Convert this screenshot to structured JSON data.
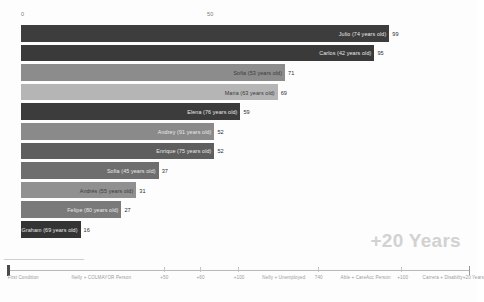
{
  "chart_data": {
    "type": "bar",
    "orientation": "horizontal",
    "title": "",
    "xlabel": "",
    "ylabel": "",
    "xlim": [
      0,
      110
    ],
    "grid": false,
    "axis_ticks": [
      {
        "label": "0",
        "value": 0
      },
      {
        "label": "50",
        "value": 50
      }
    ],
    "categories": [
      "Julio (74 years old)",
      "Carlos (42 years old)",
      "Sofia (53 years old)",
      "Maria (63 years old)",
      "Elena (76 years old)",
      "Andrey (91 years old)",
      "Enrique (75 years old)",
      "Sofia (45 years old)",
      "Andrés (55 years old)",
      "Felipe (80 years old)",
      "Graham (69 years old)"
    ],
    "values": [
      99,
      95,
      71,
      69,
      59,
      52,
      52,
      37,
      31,
      27,
      16
    ],
    "bar_colors": [
      "#3d3d3d",
      "#3a3a3a",
      "#8c8c8c",
      "#b5b5b5",
      "#3c3c3c",
      "#8a8a8a",
      "#5e5e5e",
      "#6e6e6e",
      "#909090",
      "#7a7a7a",
      "#343434"
    ],
    "annotation": "+20 Years"
  },
  "timeline": {
    "labels": [
      {
        "text": "First Condition",
        "pos": 1.6
      },
      {
        "text": "Nelly + COLMAYOR Person",
        "pos": 15.0
      },
      {
        "text": "+50",
        "pos": 33.6
      },
      {
        "text": "+60",
        "pos": 41.2
      },
      {
        "text": "+100",
        "pos": 49.0
      },
      {
        "text": "Nelly + Unemployed",
        "pos": 55.0
      },
      {
        "text": "740",
        "pos": 66.0
      },
      {
        "text": "Able + CareAcc Person",
        "pos": 71.4
      },
      {
        "text": "+100",
        "pos": 83.3
      },
      {
        "text": "Carrera + Disabilty",
        "pos": 88.6
      },
      {
        "text": "+20 Years",
        "pos": 97.0
      }
    ],
    "markers": [
      34.4,
      42.0,
      49.8,
      66.6,
      84.1
    ]
  }
}
